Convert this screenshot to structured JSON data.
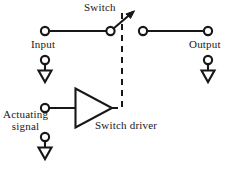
{
  "figure": {
    "type": "circuit-schematic",
    "background_color": "#ffffff",
    "ink_color": "#171717"
  },
  "labels": {
    "switch": "Switch",
    "input": "Input",
    "output": "Output",
    "switch_driver": "Switch driver",
    "actuating_signal_line1": "Actuating",
    "actuating_signal_line2": "signal"
  },
  "components": [
    {
      "name": "input-terminal",
      "kind": "terminal-node",
      "label": "Input",
      "position": {
        "x": 45,
        "y": 31
      }
    },
    {
      "name": "switch-pivot-contact",
      "kind": "terminal-node",
      "label": "Switch",
      "position": {
        "x": 110,
        "y": 31
      }
    },
    {
      "name": "switch-blade",
      "kind": "arrow-blade",
      "from": {
        "x": 113,
        "y": 29
      },
      "to": {
        "x": 133,
        "y": 12
      }
    },
    {
      "name": "switch-right-contact",
      "kind": "terminal-node",
      "position": {
        "x": 143,
        "y": 31
      }
    },
    {
      "name": "output-terminal",
      "kind": "terminal-node",
      "label": "Output",
      "position": {
        "x": 208,
        "y": 31
      }
    },
    {
      "name": "input-ground",
      "kind": "ground-symbol",
      "position": {
        "x": 45,
        "y": 60
      }
    },
    {
      "name": "output-ground",
      "kind": "ground-symbol",
      "position": {
        "x": 208,
        "y": 60
      }
    },
    {
      "name": "actuating-signal-terminal",
      "kind": "terminal-node",
      "label": "Actuating signal",
      "position": {
        "x": 45,
        "y": 108
      }
    },
    {
      "name": "actuating-ground",
      "kind": "ground-symbol",
      "position": {
        "x": 45,
        "y": 137
      }
    },
    {
      "name": "switch-driver-amplifier",
      "kind": "triangle-amplifier",
      "label": "Switch driver",
      "apex": {
        "x": 112,
        "y": 108
      },
      "base_x": 75,
      "base_top_y": 88,
      "base_bottom_y": 128
    },
    {
      "name": "control-link",
      "kind": "dashed-control-line",
      "path": "from amplifier apex right then up to switch pivot"
    }
  ],
  "wires": [
    {
      "name": "input-wire",
      "from": {
        "x": 50,
        "y": 31
      },
      "to": {
        "x": 106,
        "y": 31
      }
    },
    {
      "name": "output-wire",
      "from": {
        "x": 148,
        "y": 31
      },
      "to": {
        "x": 203,
        "y": 31
      }
    },
    {
      "name": "actuating-wire",
      "from": {
        "x": 50,
        "y": 108
      },
      "to": {
        "x": 75,
        "y": 108
      }
    }
  ]
}
